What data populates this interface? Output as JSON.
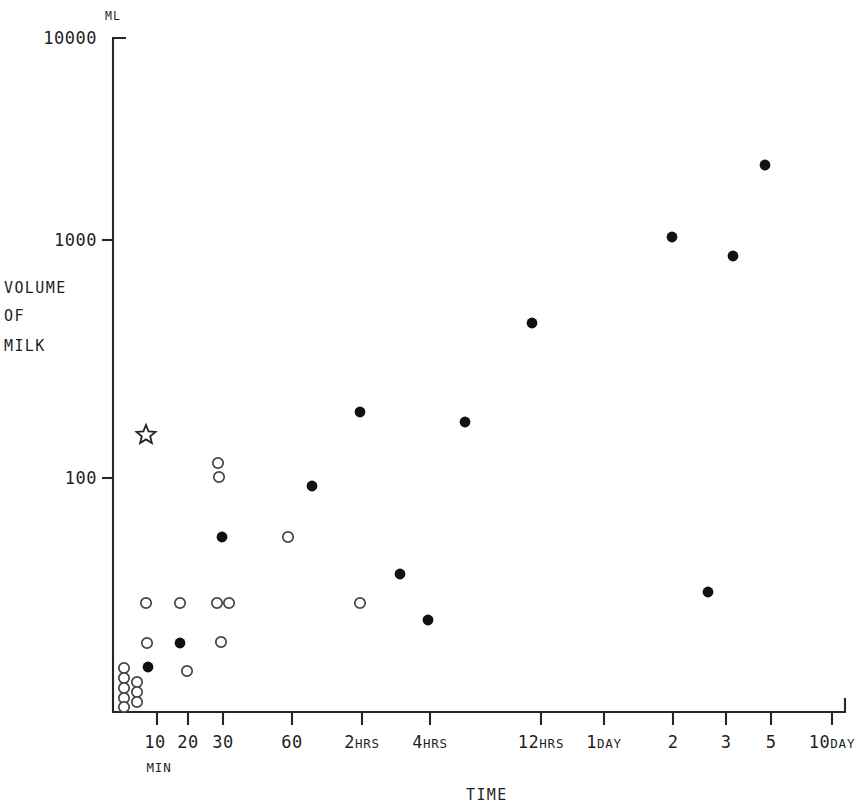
{
  "chart_data": {
    "type": "scatter",
    "title": "",
    "xlabel": "TIME",
    "ylabel": "VOLUME OF MILK",
    "y_unit": "ML",
    "y_scale": "log",
    "x_scale": "log",
    "ylim": [
      10,
      10000
    ],
    "y_ticks": [
      {
        "label": "10000",
        "value": 10000,
        "py": 38
      },
      {
        "label": "1000",
        "value": 1000,
        "py": 240
      },
      {
        "label": "100",
        "value": 100,
        "py": 478
      }
    ],
    "x_ticks": [
      {
        "label": "10",
        "unit": "MIN",
        "px": 157
      },
      {
        "label": "20",
        "unit": "",
        "px": 188
      },
      {
        "label": "30",
        "unit": "",
        "px": 223
      },
      {
        "label": "60",
        "unit": "",
        "px": 292
      },
      {
        "label": "2",
        "unit": "HRS",
        "px": 362
      },
      {
        "label": "4",
        "unit": "HRS",
        "px": 430
      },
      {
        "label": "12",
        "unit": "HRS",
        "px": 541
      },
      {
        "label": "1",
        "unit": "DAY",
        "px": 604
      },
      {
        "label": "2",
        "unit": "",
        "px": 673
      },
      {
        "label": "3",
        "unit": "",
        "px": 726
      },
      {
        "label": "5",
        "unit": "",
        "px": 771
      },
      {
        "label": "10",
        "unit": "DAY",
        "px": 832
      }
    ],
    "axis_geometry": {
      "origin_x": 113,
      "origin_y": 712,
      "top_y": 38,
      "right_x": 845
    },
    "legend": [
      {
        "name": "filled-circle",
        "marker": "filled",
        "description": "solid data point"
      },
      {
        "name": "open-circle",
        "marker": "open",
        "description": "hollow data point"
      },
      {
        "name": "star",
        "marker": "star",
        "description": "star reference point"
      }
    ],
    "series": [
      {
        "name": "open-circle",
        "marker": "open",
        "points": [
          {
            "px": 124,
            "py": 668
          },
          {
            "px": 124,
            "py": 678
          },
          {
            "px": 124,
            "py": 688
          },
          {
            "px": 124,
            "py": 698
          },
          {
            "px": 124,
            "py": 707
          },
          {
            "px": 137,
            "py": 682
          },
          {
            "px": 137,
            "py": 692
          },
          {
            "px": 137,
            "py": 702
          },
          {
            "px": 146,
            "py": 603
          },
          {
            "px": 147,
            "py": 643
          },
          {
            "px": 180,
            "py": 603
          },
          {
            "px": 187,
            "py": 671
          },
          {
            "px": 218,
            "py": 463
          },
          {
            "px": 219,
            "py": 477
          },
          {
            "px": 217,
            "py": 603
          },
          {
            "px": 229,
            "py": 603
          },
          {
            "px": 221,
            "py": 642
          },
          {
            "px": 288,
            "py": 537
          },
          {
            "px": 360,
            "py": 603
          }
        ]
      },
      {
        "name": "filled-circle",
        "marker": "filled",
        "points": [
          {
            "px": 148,
            "py": 667
          },
          {
            "px": 180,
            "py": 643
          },
          {
            "px": 222,
            "py": 537
          },
          {
            "px": 312,
            "py": 486
          },
          {
            "px": 360,
            "py": 412
          },
          {
            "px": 400,
            "py": 574
          },
          {
            "px": 428,
            "py": 620
          },
          {
            "px": 465,
            "py": 422
          },
          {
            "px": 532,
            "py": 323
          },
          {
            "px": 672,
            "py": 237
          },
          {
            "px": 708,
            "py": 592
          },
          {
            "px": 733,
            "py": 256
          },
          {
            "px": 765,
            "py": 165
          }
        ]
      },
      {
        "name": "star",
        "marker": "star",
        "points": [
          {
            "px": 146,
            "py": 435
          }
        ]
      }
    ]
  },
  "axis_titles": {
    "y_line1": "VOLUME",
    "y_line2": "OF",
    "y_line3": "MILK",
    "x": "TIME",
    "y_unit": "ML"
  }
}
